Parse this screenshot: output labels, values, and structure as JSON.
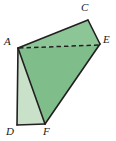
{
  "figure": {
    "background_color": "#ffffff",
    "outline_color": "#231f20",
    "fill_main": "#7fbe8b",
    "fill_side": "#c9e0c9",
    "fill_top": "#8cc596",
    "dashed_edge_color": "#231f20",
    "width": 116,
    "height": 141
  },
  "labels": {
    "a": "A",
    "c": "C",
    "d": "D",
    "e": "E",
    "f": "F"
  },
  "geometry": {
    "points": {
      "A": [
        18,
        48
      ],
      "C": [
        88,
        20
      ],
      "D": [
        17,
        125
      ],
      "E": [
        100,
        44
      ],
      "F": [
        45,
        124
      ]
    },
    "faces": [
      {
        "name": "face-upper-ACE",
        "points": "18,48 88,20 100,44",
        "fill": "#8cc596"
      },
      {
        "name": "face-main-AEF",
        "points": "18,48 100,44 45,124",
        "fill": "#7fbe8b"
      },
      {
        "name": "face-side-ADF",
        "points": "18,48 17,125 45,124",
        "fill": "#c9e0c9"
      }
    ],
    "solid_edges": [
      {
        "name": "edge-AC",
        "from": "A",
        "to": "C"
      },
      {
        "name": "edge-CE",
        "from": "C",
        "to": "E"
      },
      {
        "name": "edge-EF",
        "from": "E",
        "to": "F"
      },
      {
        "name": "edge-FD",
        "from": "F",
        "to": "D"
      },
      {
        "name": "edge-DA",
        "from": "D",
        "to": "A"
      },
      {
        "name": "edge-AF",
        "from": "A",
        "to": "F"
      }
    ],
    "dashed_edges": [
      {
        "name": "edge-AE",
        "from": "A",
        "to": "E"
      }
    ]
  },
  "label_positions": {
    "a": {
      "left": 4,
      "top": 36
    },
    "c": {
      "left": 81,
      "top": 2
    },
    "d": {
      "left": 6,
      "top": 126
    },
    "e": {
      "left": 103,
      "top": 34
    },
    "f": {
      "left": 43,
      "top": 126
    }
  }
}
